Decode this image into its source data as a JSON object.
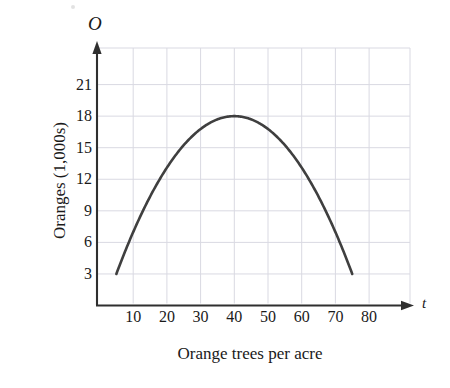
{
  "chart_data": {
    "type": "line",
    "title": "",
    "subtitle": "",
    "xlabel": "Orange trees per acre",
    "ylabel": "Oranges (1,000s)",
    "x_axis_name": "t",
    "y_axis_name": "O",
    "xticks": [
      10,
      20,
      30,
      40,
      50,
      60,
      70,
      80
    ],
    "yticks": [
      3,
      6,
      9,
      12,
      15,
      18,
      21
    ],
    "xlim": [
      0,
      92
    ],
    "ylim": [
      0,
      23
    ],
    "grid": true,
    "legend": null,
    "series": [
      {
        "name": "Orange yield",
        "shape": "downward parabola",
        "vertex": [
          40,
          18
        ],
        "x_intercepts_visible": [
          5,
          75
        ],
        "endpoints": [
          [
            5,
            3
          ],
          [
            75,
            3
          ]
        ],
        "x": [
          5,
          10,
          15,
          20,
          25,
          30,
          35,
          40,
          45,
          50,
          55,
          60,
          65,
          70,
          75
        ],
        "y": [
          3.0,
          7.3,
          10.9,
          13.8,
          16.0,
          17.5,
          18.3,
          18.0,
          18.3,
          17.5,
          16.0,
          13.8,
          10.9,
          7.3,
          3.0
        ],
        "color": "#3f3f3f"
      }
    ],
    "colors": {
      "curve": "#3f3f3f",
      "axis": "#2f2f2f",
      "grid": "#d9d9e2",
      "text": "#1a1a1a",
      "background": "#ffffff"
    }
  },
  "figure": {
    "axis_name_y": "O",
    "axis_name_x": "t",
    "ylabel": "Oranges (1,000s)",
    "xlabel": "Orange trees per acre",
    "yticks": [
      "21",
      "18",
      "15",
      "12",
      "9",
      "6",
      "3"
    ],
    "xticks": [
      "10",
      "20",
      "30",
      "40",
      "50",
      "60",
      "70",
      "80"
    ]
  }
}
